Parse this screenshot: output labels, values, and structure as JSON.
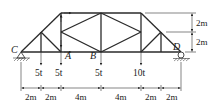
{
  "diagram": {
    "type": "truss",
    "nodes": {
      "C": "C",
      "A": "A",
      "B": "B",
      "D": "D"
    },
    "loads": [
      {
        "label": "5t",
        "x": 41
      },
      {
        "label": "5t",
        "x": 61
      },
      {
        "label": "5t",
        "x": 101
      },
      {
        "label": "10t",
        "x": 141
      }
    ],
    "horizontal_dimensions": [
      "2m",
      "2m",
      "4m",
      "4m",
      "2m",
      "2m"
    ],
    "vertical_dimensions": [
      "2m",
      "2m"
    ],
    "colors": {
      "line": "#2a2a2a",
      "background": "#ffffff"
    }
  }
}
